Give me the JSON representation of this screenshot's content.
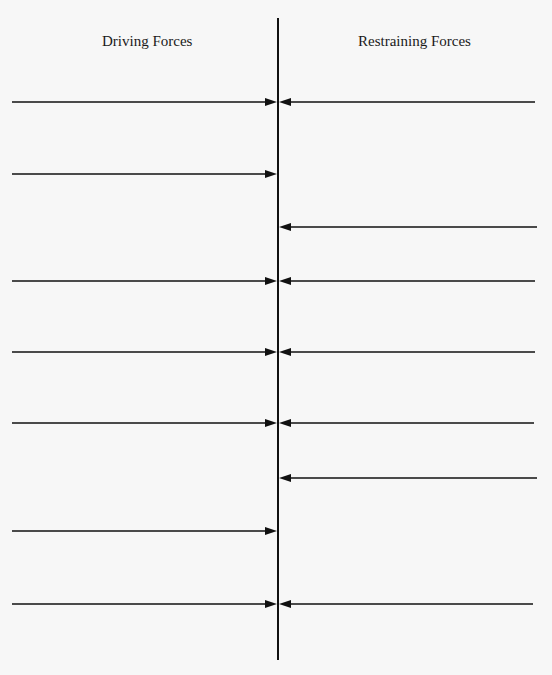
{
  "diagram": {
    "type": "force-field-analysis",
    "headers": {
      "left": "Driving Forces",
      "right": "Restraining Forces"
    },
    "center_line": {
      "x": 278,
      "y_top": 18,
      "y_bottom": 660
    },
    "rows": [
      {
        "y": 102,
        "driving": true,
        "restraining": true,
        "left_x": 12,
        "right_x": 535
      },
      {
        "y": 174,
        "driving": true,
        "restraining": false,
        "left_x": 12,
        "right_x": 535
      },
      {
        "y": 227,
        "driving": false,
        "restraining": true,
        "left_x": 12,
        "right_x": 537
      },
      {
        "y": 281,
        "driving": true,
        "restraining": true,
        "left_x": 12,
        "right_x": 535
      },
      {
        "y": 352,
        "driving": true,
        "restraining": true,
        "left_x": 12,
        "right_x": 535
      },
      {
        "y": 423,
        "driving": true,
        "restraining": true,
        "left_x": 12,
        "right_x": 534
      },
      {
        "y": 478,
        "driving": false,
        "restraining": true,
        "left_x": 12,
        "right_x": 537
      },
      {
        "y": 531,
        "driving": true,
        "restraining": false,
        "left_x": 12,
        "right_x": 535
      },
      {
        "y": 604,
        "driving": true,
        "restraining": true,
        "left_x": 12,
        "right_x": 533
      }
    ],
    "colors": {
      "line": "#111111",
      "background": "#f7f7f7"
    }
  }
}
